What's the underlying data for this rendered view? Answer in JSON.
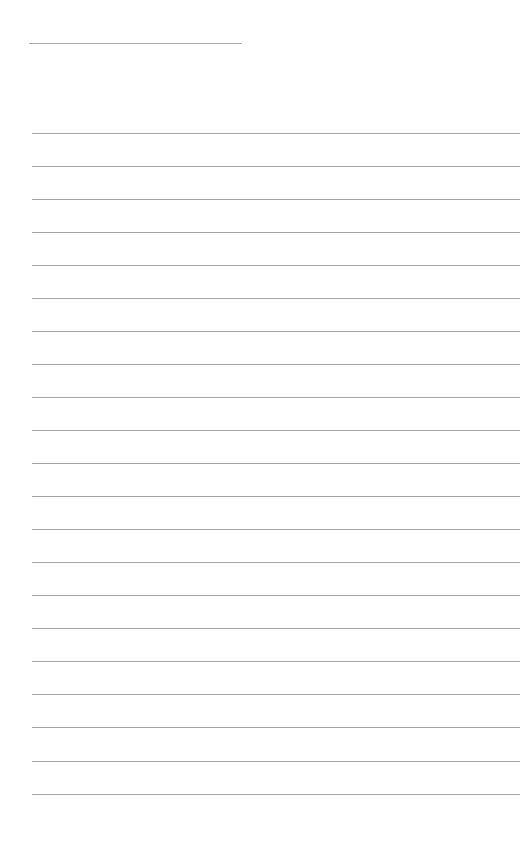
{
  "page": {
    "type": "ruled-notebook-page",
    "background_color": "#ffffff",
    "line_color": "#a4a4a4",
    "header_line": {
      "x": 29,
      "y": 43,
      "width": 213
    },
    "rules": {
      "count": 21,
      "x": 32,
      "width": 488,
      "y_positions": [
        133,
        166,
        199,
        232,
        265,
        298,
        331,
        364,
        397,
        430,
        463,
        496,
        529,
        562,
        595,
        628,
        661,
        694,
        727,
        761,
        794
      ]
    },
    "text_content": []
  }
}
